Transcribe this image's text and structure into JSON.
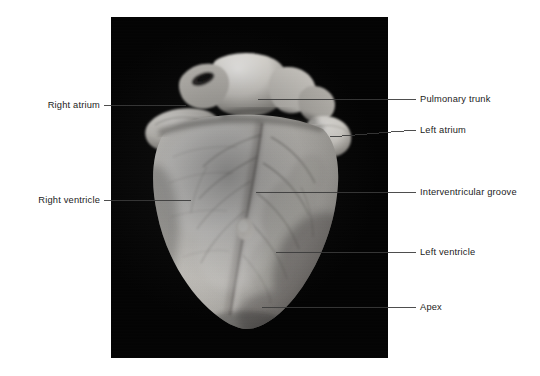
{
  "figure": {
    "kind": "anatomical-specimen-photograph",
    "view": "anterior",
    "plate_background_color": "#030303",
    "page_background_color": "#ffffff",
    "label_text_color": "#1b1b1b",
    "leader_line_color": "#3b3b3b",
    "specimen_tone_light": "#f2f0ec",
    "specimen_tone_mid": "#c9c6c0",
    "specimen_tone_dark": "#7e7b76"
  },
  "labels": [
    {
      "id": "right-atrium",
      "text": "Right atrium",
      "side": "left",
      "text_right_px": 100,
      "text_baseline_y_px": 109,
      "leader": {
        "x1": 104,
        "y1": 105,
        "x2": 186,
        "y2": 105
      }
    },
    {
      "id": "right-ventricle",
      "text": "Right ventricle",
      "side": "left",
      "text_right_px": 100,
      "text_baseline_y_px": 205,
      "leader": {
        "x1": 104,
        "y1": 200,
        "x2": 191,
        "y2": 200
      }
    },
    {
      "id": "pulmonary-trunk",
      "text": "Pulmonary trunk",
      "side": "right",
      "text_left_px": 420,
      "text_baseline_y_px": 103,
      "leader": {
        "x1": 258,
        "y1": 99,
        "x2": 416,
        "y2": 99
      }
    },
    {
      "id": "left-atrium",
      "text": "Left atrium",
      "side": "right",
      "text_left_px": 420,
      "text_baseline_y_px": 134,
      "leader": {
        "x1": 330,
        "y1": 137,
        "x2": 416,
        "y2": 130
      }
    },
    {
      "id": "interventricular-groove",
      "text": "Interventricular groove",
      "side": "right",
      "text_left_px": 420,
      "text_baseline_y_px": 196,
      "leader": {
        "x1": 256,
        "y1": 192,
        "x2": 416,
        "y2": 192
      }
    },
    {
      "id": "left-ventricle",
      "text": "Left ventricle",
      "side": "right",
      "text_left_px": 420,
      "text_baseline_y_px": 256,
      "leader": {
        "x1": 276,
        "y1": 252,
        "x2": 416,
        "y2": 252
      }
    },
    {
      "id": "apex",
      "text": "Apex",
      "side": "right",
      "text_left_px": 420,
      "text_baseline_y_px": 311,
      "leader": {
        "x1": 262,
        "y1": 307,
        "x2": 416,
        "y2": 307
      }
    }
  ]
}
